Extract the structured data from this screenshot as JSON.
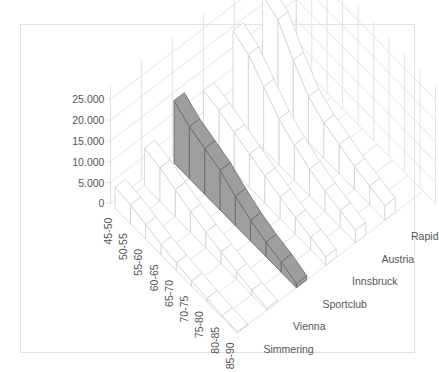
{
  "chart_data": {
    "type": "3d-line",
    "title": "",
    "xlabel": "",
    "ylabel": "",
    "zlabel": "",
    "categories": [
      "45-50",
      "50-55",
      "55-60",
      "60-65",
      "65-70",
      "70-75",
      "75-80",
      "80-85",
      "85-90"
    ],
    "y_ticks": [
      "0",
      "5.000",
      "10.000",
      "15.000",
      "20.000",
      "25.000"
    ],
    "ylim": [
      0,
      25000
    ],
    "series": [
      {
        "name": "Simmering",
        "values": [
          5000,
          4500,
          3500,
          2500,
          1800,
          1200,
          800,
          400,
          200
        ]
      },
      {
        "name": "Vienna",
        "values": [
          9000,
          8000,
          6500,
          5000,
          3800,
          2800,
          1900,
          1100,
          500
        ]
      },
      {
        "name": "Sportclub",
        "values": [
          15000,
          12500,
          11000,
          9500,
          7000,
          5000,
          3500,
          2500,
          1000
        ],
        "highlight": true
      },
      {
        "name": "Innsbruck",
        "values": [
          12000,
          11000,
          9500,
          8000,
          6500,
          5200,
          4000,
          3000,
          2000
        ]
      },
      {
        "name": "Austria",
        "values": [
          21000,
          19000,
          15000,
          11000,
          8500,
          6500,
          5000,
          4000,
          3000
        ]
      },
      {
        "name": "Rapid",
        "values": [
          24000,
          22000,
          16000,
          11000,
          8500,
          7000,
          5500,
          4500,
          3500
        ]
      }
    ],
    "grid": true,
    "legend": "none (series names on depth axis)"
  },
  "colors": {
    "highlight": "#9e9e9e",
    "grid": "#d8d8d8",
    "text": "#555555"
  }
}
